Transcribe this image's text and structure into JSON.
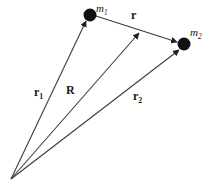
{
  "figure": {
    "type": "vector-diagram",
    "background_color": "#ffffff",
    "line_color": "#3c3c3c",
    "mass_color": "#111111"
  },
  "masses": [
    {
      "id": "m1",
      "label": "m",
      "subscript": "1",
      "x": 90,
      "y": 15,
      "radius": 6.5
    },
    {
      "id": "m2",
      "label": "m",
      "subscript": "2",
      "x": 184,
      "y": 44,
      "radius": 6.5
    }
  ],
  "origin": {
    "x": 11,
    "y": 179
  },
  "vectors": [
    {
      "id": "r1",
      "label": "r",
      "subscript": "1",
      "from": "origin",
      "to": "m1"
    },
    {
      "id": "R",
      "label": "R",
      "subscript": "",
      "from": "origin",
      "to": "midpoint"
    },
    {
      "id": "r2",
      "label": "r",
      "subscript": "2",
      "from": "origin",
      "to": "m2"
    },
    {
      "id": "r",
      "label": "r",
      "subscript": "",
      "from": "m1",
      "to": "m2"
    }
  ],
  "labels": {
    "m1": {
      "text": "m",
      "sub": "1"
    },
    "m2": {
      "text": "m",
      "sub": "2"
    },
    "r1": {
      "text": "r",
      "sub": "1"
    },
    "R": {
      "text": "R",
      "sub": ""
    },
    "r2": {
      "text": "r",
      "sub": "2"
    },
    "r": {
      "text": "r",
      "sub": ""
    }
  }
}
